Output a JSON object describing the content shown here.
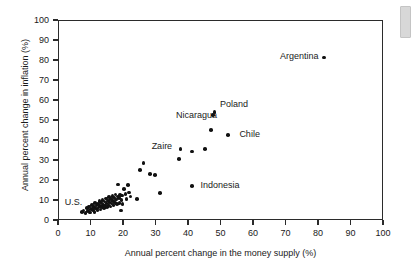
{
  "chart_data": {
    "type": "scatter",
    "title": "",
    "xlabel": "Annual percent change in the money supply (%)",
    "ylabel": "Annual percent change in inflation (%)",
    "xlim": [
      0,
      100
    ],
    "ylim": [
      0,
      100
    ],
    "xticks": [
      0,
      10,
      20,
      30,
      40,
      50,
      60,
      70,
      80,
      90,
      100
    ],
    "yticks": [
      0,
      10,
      20,
      30,
      40,
      50,
      60,
      70,
      80,
      90,
      100
    ],
    "grid": false,
    "legend": "none",
    "marker_color": "#111111",
    "points": [
      [
        7.0,
        4.5
      ],
      [
        7.6,
        5.2
      ],
      [
        8.2,
        4.0
      ],
      [
        8.6,
        6.4
      ],
      [
        9.0,
        5.0
      ],
      [
        9.3,
        7.2
      ],
      [
        9.6,
        4.2
      ],
      [
        9.9,
        6.0
      ],
      [
        10.2,
        8.1
      ],
      [
        10.4,
        5.5
      ],
      [
        10.7,
        7.0
      ],
      [
        10.9,
        4.6
      ],
      [
        11.1,
        9.0
      ],
      [
        11.3,
        6.2
      ],
      [
        11.6,
        7.8
      ],
      [
        11.8,
        5.4
      ],
      [
        12.0,
        8.6
      ],
      [
        12.2,
        6.8
      ],
      [
        12.4,
        10.0
      ],
      [
        12.6,
        7.4
      ],
      [
        12.8,
        5.8
      ],
      [
        13.0,
        9.2
      ],
      [
        13.2,
        7.1
      ],
      [
        13.4,
        10.6
      ],
      [
        13.6,
        8.3
      ],
      [
        13.8,
        6.5
      ],
      [
        14.0,
        9.8
      ],
      [
        14.2,
        7.7
      ],
      [
        14.4,
        11.2
      ],
      [
        14.6,
        8.9
      ],
      [
        14.8,
        6.9
      ],
      [
        15.0,
        10.3
      ],
      [
        15.2,
        8.0
      ],
      [
        15.4,
        12.0
      ],
      [
        15.6,
        9.5
      ],
      [
        15.8,
        7.3
      ],
      [
        16.0,
        11.0
      ],
      [
        16.2,
        8.7
      ],
      [
        16.4,
        12.6
      ],
      [
        16.6,
        10.1
      ],
      [
        16.8,
        7.9
      ],
      [
        17.0,
        11.8
      ],
      [
        17.2,
        9.3
      ],
      [
        17.4,
        13.2
      ],
      [
        17.6,
        10.8
      ],
      [
        17.8,
        8.4
      ],
      [
        18.0,
        12.3
      ],
      [
        18.2,
        18.2
      ],
      [
        18.4,
        11.4
      ],
      [
        18.6,
        9.0
      ],
      [
        18.8,
        13.0
      ],
      [
        19.0,
        5.2
      ],
      [
        19.2,
        10.4
      ],
      [
        19.4,
        12.8
      ],
      [
        19.6,
        8.6
      ],
      [
        20.0,
        16.0
      ],
      [
        20.4,
        13.6
      ],
      [
        20.8,
        11.0
      ],
      [
        21.2,
        18.0
      ],
      [
        21.6,
        14.2
      ],
      [
        22.0,
        12.2
      ],
      [
        24.0,
        11.0
      ],
      [
        25.0,
        25.5
      ],
      [
        26.0,
        29.0
      ],
      [
        28.0,
        23.5
      ],
      [
        29.5,
        23.0
      ],
      [
        31.0,
        14.0
      ],
      [
        37.0,
        31.0
      ],
      [
        37.4,
        36.0
      ],
      [
        41.0,
        34.8
      ],
      [
        41.0,
        17.6
      ],
      [
        45.0,
        36.0
      ],
      [
        46.8,
        45.6
      ],
      [
        47.4,
        53.0
      ],
      [
        47.8,
        54.6
      ],
      [
        52.0,
        43.0
      ],
      [
        81.5,
        81.7
      ]
    ],
    "annotations": [
      {
        "label": "Argentina",
        "x": 68.0,
        "y": 82.0
      },
      {
        "label": "Poland",
        "x": 49.5,
        "y": 58.0
      },
      {
        "label": "Nicaragua",
        "x": 36.0,
        "y": 52.5
      },
      {
        "label": "Chile",
        "x": 55.5,
        "y": 43.0
      },
      {
        "label": "Zaire",
        "x": 28.5,
        "y": 37.0
      },
      {
        "label": "Indonesia",
        "x": 43.5,
        "y": 17.5
      },
      {
        "label": "U.S.",
        "x": 1.8,
        "y": 9.0
      }
    ]
  }
}
